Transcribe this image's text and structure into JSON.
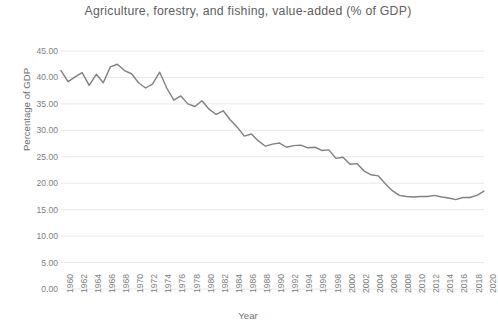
{
  "chart_data": {
    "type": "line",
    "title": "Agriculture, forestry, and fishing, value-added (% of GDP)",
    "xlabel": "Year",
    "ylabel": "Percentage of GDP",
    "ylim": [
      0,
      45
    ],
    "ytick_step": 5,
    "ytick_labels": [
      "0.00",
      "5.00",
      "10.00",
      "15.00",
      "20.00",
      "25.00",
      "30.00",
      "35.00",
      "40.00",
      "45.00"
    ],
    "ytick_values": [
      0,
      5,
      10,
      15,
      20,
      25,
      30,
      35,
      40,
      45
    ],
    "xlim": [
      1960,
      2020
    ],
    "xtick_labels": [
      "1960",
      "1962",
      "1964",
      "1966",
      "1968",
      "1970",
      "1972",
      "1974",
      "1976",
      "1978",
      "1980",
      "1982",
      "1984",
      "1986",
      "1988",
      "1990",
      "1992",
      "1994",
      "1996",
      "1998",
      "2000",
      "2002",
      "2004",
      "2006",
      "2008",
      "2010",
      "2012",
      "2014",
      "2016",
      "2018",
      "2020"
    ],
    "grid": true,
    "grid_axis": "y",
    "legend": false,
    "line_color": "#808080",
    "x": [
      1960,
      1961,
      1962,
      1963,
      1964,
      1965,
      1966,
      1967,
      1968,
      1969,
      1970,
      1971,
      1972,
      1973,
      1974,
      1975,
      1976,
      1977,
      1978,
      1979,
      1980,
      1981,
      1982,
      1983,
      1984,
      1985,
      1986,
      1987,
      1988,
      1989,
      1990,
      1991,
      1992,
      1993,
      1994,
      1995,
      1996,
      1997,
      1998,
      1999,
      2000,
      2001,
      2002,
      2003,
      2004,
      2005,
      2006,
      2007,
      2008,
      2009,
      2010,
      2011,
      2012,
      2013,
      2014,
      2015,
      2016,
      2017,
      2018,
      2019,
      2020
    ],
    "values": [
      41.3,
      39.2,
      40.1,
      40.9,
      38.5,
      40.6,
      39.0,
      42.0,
      42.5,
      41.3,
      40.7,
      39.0,
      38.0,
      38.8,
      41.0,
      38.0,
      35.7,
      36.5,
      35.0,
      34.5,
      35.6,
      34.0,
      33.0,
      33.7,
      32.0,
      30.6,
      28.9,
      29.3,
      28.0,
      27.0,
      27.4,
      27.6,
      26.8,
      27.1,
      27.2,
      26.7,
      26.8,
      26.2,
      26.3,
      24.7,
      24.9,
      23.6,
      23.7,
      22.3,
      21.6,
      21.4,
      19.9,
      18.6,
      17.7,
      17.5,
      17.4,
      17.5,
      17.5,
      17.7,
      17.4,
      17.2,
      16.9,
      17.3,
      17.3,
      17.7,
      18.5
    ]
  }
}
